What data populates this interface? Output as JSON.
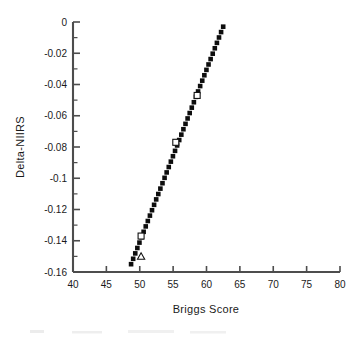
{
  "chart_data": {
    "type": "scatter",
    "title": "",
    "xlabel": "Briggs Score",
    "ylabel": "Delta-NIIRS",
    "xlim": [
      40,
      80
    ],
    "ylim": [
      -0.16,
      0
    ],
    "xticks": [
      40,
      45,
      50,
      55,
      60,
      65,
      70,
      75,
      80
    ],
    "xtick_labels": [
      "40",
      "45",
      "50",
      "55",
      "60",
      "65",
      "70",
      "75",
      "80"
    ],
    "yticks": [
      0,
      -0.02,
      -0.04,
      -0.06,
      -0.08,
      -0.1,
      -0.12,
      -0.14,
      -0.16
    ],
    "ytick_labels": [
      "0",
      "-0.02",
      "-0.04",
      "-0.06",
      "-0.08",
      "-0.1",
      "-0.12",
      "-0.14",
      "-0.16"
    ],
    "y_minor_tick_step": 0.01,
    "grid": false,
    "legend": null,
    "series": [
      {
        "name": "trend-line",
        "style": "thick-dotted",
        "color": "#0d0d0d",
        "x": [
          48.7,
          62.5
        ],
        "y": [
          -0.155,
          -0.003
        ],
        "n_dots": 44
      },
      {
        "name": "data-markers",
        "style": "open-markers",
        "color": "#111111",
        "points": [
          {
            "x": 50.2,
            "y": -0.137,
            "marker": "square"
          },
          {
            "x": 50.2,
            "y": -0.15,
            "marker": "triangle"
          },
          {
            "x": 55.4,
            "y": -0.077,
            "marker": "square"
          },
          {
            "x": 58.6,
            "y": -0.047,
            "marker": "square"
          }
        ]
      }
    ]
  },
  "axes": {
    "x_title": "Briggs  Score",
    "y_title": "Delta-NIIRS"
  }
}
